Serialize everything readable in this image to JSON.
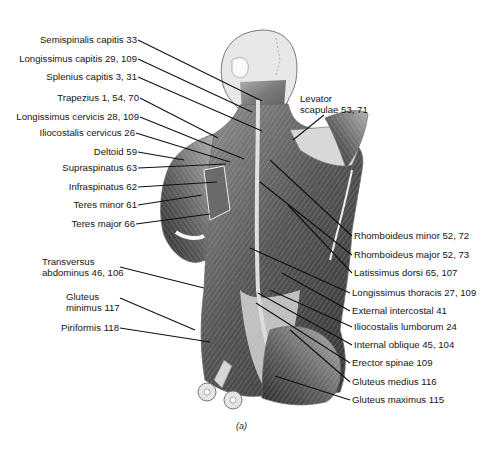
{
  "figure": {
    "caption": "(a)",
    "left_labels": [
      {
        "text": "Semispinalis capitis 33"
      },
      {
        "text": "Longissimus capitis 29, 109"
      },
      {
        "text": "Splenius capitis 3, 31"
      },
      {
        "text": "Trapezius 1, 54, 70"
      },
      {
        "text": "Longissimus cervicis 28, 109"
      },
      {
        "text": "Iliocostalis cervicus 26"
      },
      {
        "text": "Deltoid 59"
      },
      {
        "text": "Supraspinatus 63"
      },
      {
        "text": "Infraspinatus 62"
      },
      {
        "text": "Teres minor 61"
      },
      {
        "text": "Teres major 66"
      },
      {
        "line1": "Transversus",
        "line2": "abdominus 46, 106"
      },
      {
        "line1": "Gluteus",
        "line2": "minimus 117"
      },
      {
        "text": "Piriformis 118"
      }
    ],
    "right_labels": [
      {
        "line1": "Levator",
        "line2": "scapulae 53, 71"
      },
      {
        "text": "Rhomboideus minor 52, 72"
      },
      {
        "text": "Rhomboideus major 52, 73"
      },
      {
        "text": "Latissimus dorsi 65, 107"
      },
      {
        "text": "Longissimus thoracis 27, 109"
      },
      {
        "text": "External intercostal 41"
      },
      {
        "text": "Iliocostalis lumborum 24"
      },
      {
        "text": "Internal oblique 45, 104"
      },
      {
        "text": "Erector spinae 109"
      },
      {
        "text": "Gluteus medius 116"
      },
      {
        "text": "Gluteus maximus 115"
      }
    ]
  }
}
